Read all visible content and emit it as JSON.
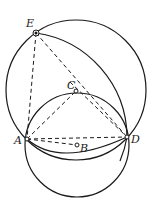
{
  "diagram": {
    "type": "geometric-construction",
    "points": {
      "E": {
        "label": "E",
        "x": 36,
        "y": 33,
        "style": "filled-dot"
      },
      "C": {
        "label": "C",
        "x": 76,
        "y": 91,
        "style": "open-dot"
      },
      "A": {
        "label": "A",
        "x": 27,
        "y": 139,
        "style": "open-dot"
      },
      "B": {
        "label": "B",
        "x": 77,
        "y": 145,
        "style": "open-dot"
      },
      "D": {
        "label": "D",
        "x": 127,
        "y": 137,
        "style": "open-dot"
      }
    },
    "circles": [
      {
        "name": "large-circle",
        "cx": 76,
        "cy": 90,
        "r": 70
      },
      {
        "name": "small-circle",
        "center": "B",
        "cx": 77,
        "cy": 145,
        "r": 52
      }
    ],
    "arcs": [
      {
        "name": "arc-E-to-D-centered-A",
        "center": "A",
        "from": "E",
        "to": "D"
      }
    ],
    "dashed_segments": [
      [
        "E",
        "A"
      ],
      [
        "E",
        "D"
      ],
      [
        "A",
        "C"
      ],
      [
        "C",
        "D"
      ],
      [
        "A",
        "D"
      ],
      [
        "A",
        "B"
      ]
    ],
    "colors": {
      "stroke": "#1a1a1a",
      "background": "#ffffff"
    }
  }
}
